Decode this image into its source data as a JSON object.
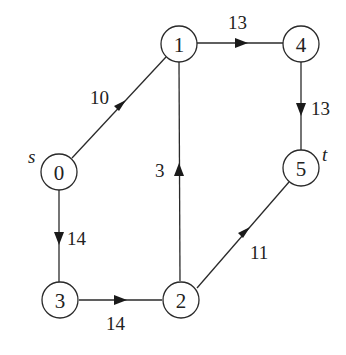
{
  "diagram": {
    "type": "directed-weighted-graph",
    "nodes": [
      {
        "id": "0",
        "label": "0",
        "x": 59,
        "y": 172,
        "tag": "s"
      },
      {
        "id": "1",
        "label": "1",
        "x": 179,
        "y": 44
      },
      {
        "id": "2",
        "label": "2",
        "x": 181,
        "y": 300
      },
      {
        "id": "3",
        "label": "3",
        "x": 60,
        "y": 300
      },
      {
        "id": "4",
        "label": "4",
        "x": 301,
        "y": 44
      },
      {
        "id": "5",
        "label": "5",
        "x": 301,
        "y": 168,
        "tag": "t"
      }
    ],
    "edges": [
      {
        "from": "0",
        "to": "1",
        "weight": "10"
      },
      {
        "from": "1",
        "to": "4",
        "weight": "13"
      },
      {
        "from": "4",
        "to": "5",
        "weight": "13"
      },
      {
        "from": "0",
        "to": "3",
        "weight": "14"
      },
      {
        "from": "3",
        "to": "2",
        "weight": "14"
      },
      {
        "from": "2",
        "to": "1",
        "weight": "3"
      },
      {
        "from": "2",
        "to": "5",
        "weight": "11"
      }
    ],
    "source_label": "s",
    "sink_label": "t"
  }
}
